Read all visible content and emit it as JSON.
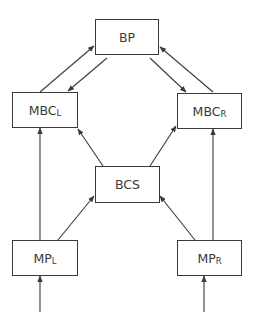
{
  "diagram": {
    "type": "flow/block diagram",
    "colors": {
      "stroke": "#3a3a3a",
      "background": "#ffffff",
      "text": "#3a3a3a"
    },
    "nodes": {
      "bp": {
        "label": "BP",
        "sub": ""
      },
      "mbcl": {
        "label": "MBC",
        "sub": "L"
      },
      "mbcr": {
        "label": "MBC",
        "sub": "R"
      },
      "bcs": {
        "label": "BCS",
        "sub": ""
      },
      "mpl": {
        "label": "MP",
        "sub": "L"
      },
      "mpr": {
        "label": "MP",
        "sub": "R"
      }
    },
    "edges": [
      {
        "from": "MBC_L",
        "to": "BP"
      },
      {
        "from": "BP",
        "to": "MBC_L"
      },
      {
        "from": "BP",
        "to": "MBC_R"
      },
      {
        "from": "MBC_R",
        "to": "BP"
      },
      {
        "from": "BCS",
        "to": "MBC_L"
      },
      {
        "from": "BCS",
        "to": "MBC_R"
      },
      {
        "from": "MP_L",
        "to": "MBC_L"
      },
      {
        "from": "MP_R",
        "to": "MBC_R"
      },
      {
        "from": "MP_L",
        "to": "BCS"
      },
      {
        "from": "MP_R",
        "to": "BCS"
      },
      {
        "from": "input",
        "to": "MP_L"
      },
      {
        "from": "input",
        "to": "MP_R"
      }
    ]
  }
}
